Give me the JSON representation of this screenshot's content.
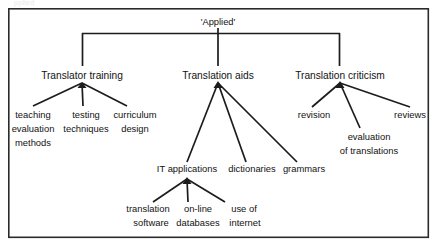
{
  "page": {
    "background_color": "#ffffff",
    "line_color": "#1c1c1c",
    "text_color": "#121212",
    "frame_color": "#2b2b2b",
    "cropped_top_text": "pplied"
  },
  "diagram": {
    "type": "tree",
    "orientation": "top-down",
    "root": {
      "id": "applied",
      "label": "'Applied'",
      "x": 218,
      "y": 22
    },
    "level2": [
      {
        "id": "translator-training",
        "label": "Translator training",
        "x": 82,
        "y": 76,
        "connector": "bracket"
      },
      {
        "id": "translation-aids",
        "label": "Translation aids",
        "x": 218,
        "y": 76,
        "connector": "bracket"
      },
      {
        "id": "translation-criticism",
        "label": "Translation criticism",
        "x": 340,
        "y": 76,
        "connector": "bracket"
      }
    ],
    "leaves": [
      {
        "id": "teaching-evaluation-methods",
        "parent": "translator-training",
        "lines": [
          "teaching",
          "evaluation",
          "methods"
        ],
        "x": 33,
        "y": 118,
        "anchor": "middle"
      },
      {
        "id": "testing-techniques",
        "parent": "translator-training",
        "lines": [
          "testing",
          "techniques"
        ],
        "x": 85,
        "y": 118,
        "anchor": "middle"
      },
      {
        "id": "curriculum-design",
        "parent": "translator-training",
        "lines": [
          "curriculum",
          "design"
        ],
        "x": 133,
        "y": 118,
        "anchor": "middle"
      },
      {
        "id": "it-applications",
        "parent": "translation-aids",
        "lines": [
          "IT applications"
        ],
        "x": 187,
        "y": 172,
        "anchor": "middle"
      },
      {
        "id": "dictionaries",
        "parent": "translation-aids",
        "lines": [
          "dictionaries"
        ],
        "x": 251,
        "y": 172,
        "anchor": "middle"
      },
      {
        "id": "grammars",
        "parent": "translation-aids",
        "lines": [
          "grammars"
        ],
        "x": 303,
        "y": 172,
        "anchor": "middle"
      },
      {
        "id": "revision",
        "parent": "translation-criticism",
        "lines": [
          "revision"
        ],
        "x": 316,
        "y": 118,
        "anchor": "middle"
      },
      {
        "id": "evaluation-of-translations",
        "parent": "translation-criticism",
        "lines": [
          "evaluation",
          "of translations"
        ],
        "x": 369,
        "y": 140,
        "anchor": "middle"
      },
      {
        "id": "reviews",
        "parent": "translation-criticism",
        "lines": [
          "reviews"
        ],
        "x": 411,
        "y": 118,
        "anchor": "middle"
      },
      {
        "id": "translation-software",
        "parent": "it-applications",
        "lines": [
          "translation",
          "software"
        ],
        "x": 148,
        "y": 212,
        "anchor": "middle"
      },
      {
        "id": "on-line-databases",
        "parent": "it-applications",
        "lines": [
          "on-line",
          "databases"
        ],
        "x": 197,
        "y": 212,
        "anchor": "middle"
      },
      {
        "id": "use-of-internet",
        "parent": "it-applications",
        "lines": [
          "use of",
          "internet"
        ],
        "x": 245,
        "y": 212,
        "anchor": "middle"
      }
    ],
    "frame": {
      "x": 8,
      "y": 8,
      "width": 421,
      "height": 230
    }
  }
}
